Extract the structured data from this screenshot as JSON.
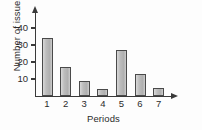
{
  "chart_data": {
    "type": "bar",
    "title": "",
    "xlabel": "Periods",
    "ylabel": "Number of issues",
    "categories": [
      "1",
      "2",
      "3",
      "4",
      "5",
      "6",
      "7"
    ],
    "values": [
      34,
      17,
      9,
      4,
      27,
      13,
      5
    ],
    "ylim": [
      0,
      45
    ],
    "yticks": [
      10,
      20,
      30,
      40
    ],
    "ytick_labels": [
      "10",
      "20",
      "30",
      "40"
    ],
    "grid": false,
    "legend": null,
    "axis_arrows": {
      "y": "arrow-up",
      "x": "arrow-right"
    },
    "bar_color": "#b9b9b9",
    "bar_edge_color": "#4a4a4a",
    "axis_color": "#3a3a3a",
    "text_color": "#2b2b2b"
  }
}
